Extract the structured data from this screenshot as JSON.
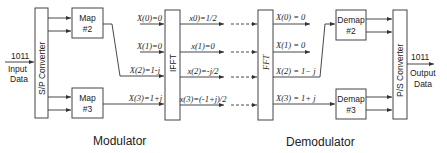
{
  "input": {
    "bits": "1011",
    "label_line1": "Input",
    "label_line2": "Data"
  },
  "output": {
    "bits": "1011",
    "label_line1": "Output",
    "label_line2": "Data"
  },
  "blocks": {
    "sp_converter": "S/P Converter",
    "map2_line1": "Map",
    "map2_line2": "#2",
    "map3_line1": "Map",
    "map3_line2": "#3",
    "ifft": "IFFT",
    "fft": "FFT",
    "demap2_line1": "Demap",
    "demap2_line2": "#2",
    "demap3_line1": "Demap",
    "demap3_line2": "#3",
    "ps_converter": "P/S Converter"
  },
  "ifft_inputs": [
    "X(0)=0",
    "X(1)=0",
    "X(2)=1-j",
    "X(3)=1+j"
  ],
  "ifft_outputs": [
    "x0)=1/2",
    "x(1)=0",
    "x(2)=-j/2",
    "x(3)=(-1+j)/2"
  ],
  "fft_outputs": [
    "X(0) = 0",
    "X(1) = 0",
    "X(2) = 1− j",
    "X(3) = 1+ j"
  ],
  "sections": {
    "modulator": "Modulator",
    "demodulator": "Demodulator"
  }
}
